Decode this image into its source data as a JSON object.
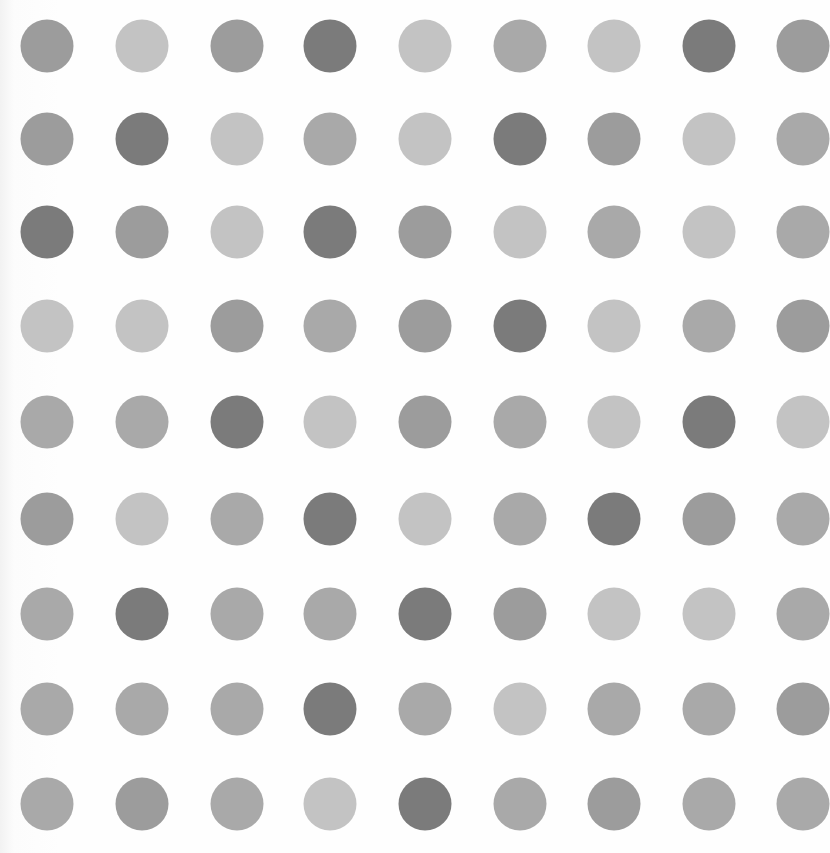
{
  "artwork": {
    "description": "Grid of gray spots on white background",
    "rows": 9,
    "cols": 9,
    "dot_diameter": 53,
    "col_centers": [
      47,
      142,
      237,
      330,
      425,
      520,
      614,
      709,
      803
    ],
    "row_centers": [
      46,
      139,
      232,
      326,
      422,
      519,
      614,
      709,
      804
    ],
    "shades": [
      "#7b7b7b",
      "#9c9c9c",
      "#a9a9a9",
      "#c3c3c3"
    ],
    "grid": [
      [
        1,
        3,
        1,
        0,
        3,
        2,
        3,
        0,
        1
      ],
      [
        1,
        0,
        3,
        2,
        3,
        0,
        1,
        3,
        2
      ],
      [
        0,
        1,
        3,
        0,
        1,
        3,
        2,
        3,
        2
      ],
      [
        3,
        3,
        1,
        2,
        1,
        0,
        3,
        2,
        1
      ],
      [
        2,
        2,
        0,
        3,
        1,
        2,
        3,
        0,
        3
      ],
      [
        1,
        3,
        2,
        0,
        3,
        2,
        0,
        1,
        2
      ],
      [
        2,
        0,
        2,
        2,
        0,
        1,
        3,
        3,
        2
      ],
      [
        2,
        2,
        2,
        0,
        2,
        3,
        2,
        2,
        1
      ],
      [
        2,
        1,
        2,
        3,
        0,
        2,
        1,
        2,
        2
      ]
    ]
  }
}
